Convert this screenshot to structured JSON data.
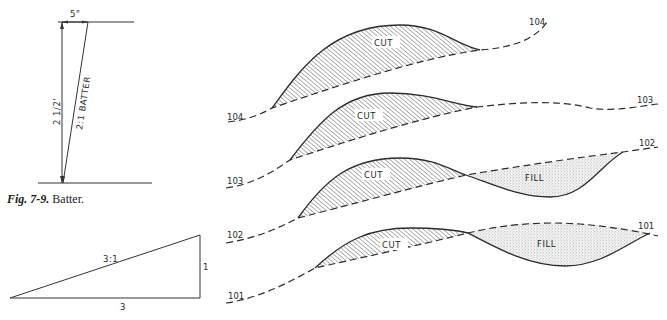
{
  "figure_batter": {
    "dimension_top": "5\"",
    "dimension_height": "2 1/2'",
    "slope_label": "2:1 BATTER",
    "caption_number": "Fig. 7-9.",
    "caption_text": "Batter."
  },
  "figure_slope": {
    "slope_label": "3:1",
    "run_label": "3",
    "rise_label": "1"
  },
  "cross_sections": {
    "cut_label": "CUT",
    "fill_label": "FILL",
    "stations": [
      {
        "left_label": "104",
        "right_label": "104",
        "regions": [
          "CUT"
        ]
      },
      {
        "left_label": "103",
        "right_label": "103",
        "regions": [
          "CUT"
        ]
      },
      {
        "left_label": "102",
        "right_label": "102",
        "regions": [
          "CUT",
          "FILL"
        ]
      },
      {
        "left_label": "101",
        "right_label": "101",
        "regions": [
          "CUT",
          "FILL"
        ]
      }
    ]
  }
}
